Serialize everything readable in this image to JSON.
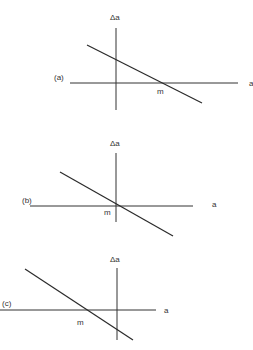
{
  "diagram": {
    "panels": [
      {
        "id": "a",
        "panel_label": "(a)",
        "y_axis_label": "Δa",
        "x_axis_label": "a",
        "point_label": "m",
        "description": "Line with negative slope crossing x-axis at m > 0"
      },
      {
        "id": "b",
        "panel_label": "(b)",
        "y_axis_label": "Δa",
        "x_axis_label": "a",
        "point_label": "m",
        "description": "Line with negative slope crossing x-axis at origin (m = 0)"
      },
      {
        "id": "c",
        "panel_label": "(c)",
        "y_axis_label": "Δa",
        "x_axis_label": "a",
        "point_label": "m",
        "description": "Line with negative slope crossing x-axis at m < 0"
      }
    ],
    "colors": {
      "ink": "#333333",
      "background": "#ffffff"
    }
  }
}
